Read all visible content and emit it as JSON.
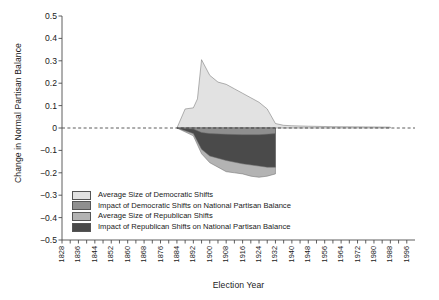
{
  "chart_data": {
    "type": "area",
    "title": "",
    "xlabel": "Election Year",
    "ylabel": "Change in Normal Partisan Balance",
    "xlim": [
      1828,
      2000
    ],
    "ylim": [
      -0.5,
      0.5
    ],
    "grid": false,
    "zero_line": true,
    "legend_position": "inside-lower-left",
    "x_tick_labels": [
      "1828",
      "1836",
      "1844",
      "1852",
      "1860",
      "1868",
      "1876",
      "1884",
      "1892",
      "1900",
      "1908",
      "1916",
      "1924",
      "1932",
      "1940",
      "1948",
      "1956",
      "1964",
      "1972",
      "1980",
      "1988",
      "1996"
    ],
    "x_tick_values": [
      1828,
      1836,
      1844,
      1852,
      1860,
      1868,
      1876,
      1884,
      1892,
      1900,
      1908,
      1916,
      1924,
      1932,
      1940,
      1948,
      1956,
      1964,
      1972,
      1980,
      1988,
      1996
    ],
    "x_minor_tick_step": 4,
    "y_tick_labels": [
      "0.5",
      "0.4",
      "0.3",
      "0.2",
      "0.1",
      "0",
      "−0.1",
      "−0.2",
      "−0.3",
      "−0.4",
      "−0.5"
    ],
    "y_tick_values": [
      0.5,
      0.4,
      0.3,
      0.2,
      0.1,
      0,
      -0.1,
      -0.2,
      -0.3,
      -0.4,
      -0.5
    ],
    "colors": {
      "avg_democratic": "#e2e2e2",
      "impact_democratic": "#8f8f8f",
      "avg_republican": "#b3b3b3",
      "impact_republican": "#4a4a4a",
      "outline": "#6b6b6b",
      "zero_line": "#333333",
      "axis": "#4d4d4d"
    },
    "series": [
      {
        "name": "Average Size of Democratic Shifts",
        "color_key": "avg_democratic",
        "x": [
          1884,
          1888,
          1892,
          1894,
          1896,
          1900,
          1904,
          1908,
          1912,
          1916,
          1920,
          1924,
          1928,
          1932,
          1936,
          1940,
          1948,
          1960,
          1976,
          1988
        ],
        "values": [
          0.0,
          0.085,
          0.09,
          0.13,
          0.305,
          0.235,
          0.205,
          0.195,
          0.175,
          0.155,
          0.135,
          0.115,
          0.085,
          0.02,
          0.012,
          0.01,
          0.008,
          0.006,
          0.005,
          0.004
        ]
      },
      {
        "name": "Impact of Democratic Shifts on National Partisan Balance",
        "color_key": "impact_democratic",
        "x": [
          1884,
          1892,
          1896,
          1900,
          1908,
          1916,
          1924,
          1932
        ],
        "values": [
          0.0,
          -0.005,
          -0.02,
          -0.025,
          -0.028,
          -0.03,
          -0.03,
          -0.025
        ]
      },
      {
        "name": "Average Size of Republican Shifts",
        "color_key": "avg_republican",
        "x": [
          1884,
          1892,
          1896,
          1900,
          1904,
          1908,
          1912,
          1916,
          1920,
          1924,
          1928,
          1932
        ],
        "values": [
          0.0,
          -0.035,
          -0.115,
          -0.155,
          -0.175,
          -0.195,
          -0.2,
          -0.205,
          -0.215,
          -0.22,
          -0.215,
          -0.205
        ]
      },
      {
        "name": "Impact of Republican Shifts on National Partisan Balance",
        "color_key": "impact_republican",
        "x": [
          1884,
          1892,
          1896,
          1900,
          1908,
          1916,
          1924,
          1928,
          1932
        ],
        "values": [
          0.0,
          -0.025,
          -0.095,
          -0.125,
          -0.145,
          -0.16,
          -0.17,
          -0.175,
          -0.175
        ]
      }
    ],
    "legend_entries": [
      {
        "label": "Average Size of Democratic Shifts",
        "color_key": "avg_democratic"
      },
      {
        "label": "Impact of Democratic Shifts on National Partisan Balance",
        "color_key": "impact_democratic"
      },
      {
        "label": "Average Size of Republican Shifts",
        "color_key": "avg_republican"
      },
      {
        "label": "Impact of Republican Shifts on National Partisan Balance",
        "color_key": "impact_republican"
      }
    ]
  }
}
